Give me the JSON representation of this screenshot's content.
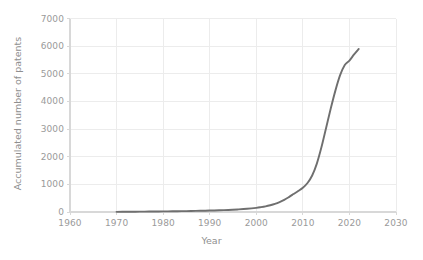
{
  "chart_data": {
    "type": "line",
    "title": "",
    "xlabel": "Year",
    "ylabel": "Accumulated number of patents",
    "xlim": [
      1960,
      2030
    ],
    "ylim": [
      0,
      7000
    ],
    "grid": true,
    "legend": null,
    "xticks": [
      1960,
      1970,
      1980,
      1990,
      2000,
      2010,
      2020,
      2030
    ],
    "yticks": [
      0,
      1000,
      2000,
      3000,
      4000,
      5000,
      6000,
      7000
    ],
    "xtick_labels": [
      "1960",
      "1970",
      "1980",
      "1990",
      "2000",
      "2010",
      "2020",
      "2030"
    ],
    "ytick_labels": [
      "0",
      "1000",
      "2000",
      "3000",
      "4000",
      "5000",
      "6000",
      "7000"
    ],
    "series": [
      {
        "name": "Accumulated patents",
        "color": "#6f6f6f",
        "x": [
          1970,
          1972,
          1974,
          1976,
          1978,
          1980,
          1982,
          1984,
          1986,
          1988,
          1990,
          1992,
          1994,
          1996,
          1998,
          2000,
          2001,
          2002,
          2003,
          2004,
          2005,
          2006,
          2007,
          2008,
          2009,
          2010,
          2011,
          2012,
          2013,
          2014,
          2015,
          2016,
          2017,
          2018,
          2019,
          2020,
          2021,
          2022
        ],
        "y": [
          5,
          8,
          11,
          14,
          17,
          21,
          25,
          30,
          36,
          43,
          52,
          62,
          75,
          92,
          115,
          150,
          175,
          205,
          245,
          295,
          360,
          440,
          540,
          650,
          760,
          880,
          1050,
          1320,
          1750,
          2350,
          3050,
          3750,
          4400,
          4950,
          5320,
          5480,
          5700,
          5900
        ]
      }
    ],
    "annotations": []
  },
  "colors": {
    "line": "#6f6f6f",
    "grid": "#ececec",
    "axis": "#d8d8d8",
    "tick_text": "#9a9a9a",
    "label_text": "#8f8f8f",
    "background": "#ffffff"
  }
}
